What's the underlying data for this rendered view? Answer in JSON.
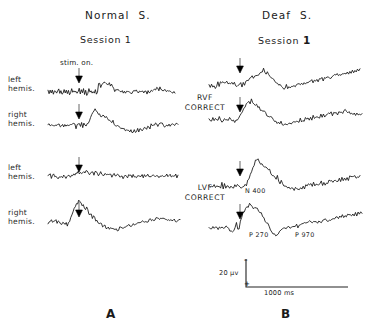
{
  "figure": {
    "columns": [
      {
        "title": "Normal  S.",
        "session": "Session 1",
        "panel_letter": "A"
      },
      {
        "title": "Deaf  S.",
        "session": "Session ",
        "session_bold": "1",
        "panel_letter": "B"
      }
    ],
    "stim_marker_label": "stim. on.",
    "conditions": [
      {
        "line1": "RVF",
        "line2": "CORRECT"
      },
      {
        "line1": "LVF",
        "line2": "CORRECT"
      }
    ],
    "row_labels": [
      {
        "line1": "left",
        "line2": "hemis."
      },
      {
        "line1": "right",
        "line2": "hemis."
      },
      {
        "line1": "left",
        "line2": "hemis."
      },
      {
        "line1": "right",
        "line2": "hemis."
      }
    ],
    "peak_labels": [
      {
        "text": "N 400"
      },
      {
        "text": "P 270"
      },
      {
        "text": "P 970"
      }
    ],
    "scale": {
      "amplitude": "20 μv",
      "time": "1000 ms",
      "negative_sign": "–",
      "positive_sign": "+"
    },
    "colors": {
      "trace": "#111111",
      "text": "#1a1a1a",
      "background": "#ffffff"
    }
  },
  "chart_data": {
    "type": "line",
    "xlabel": "time",
    "ylabel": "amplitude",
    "axis_note": "negative up",
    "x_scale_bar_ms": 1000,
    "y_scale_bar_uv": 20,
    "annotations": [
      {
        "text": "stim. on.",
        "series": "normal-rvf-left",
        "meaning": "stimulus onset arrow"
      },
      {
        "text": "N 400",
        "series": "deaf-lvf-left",
        "latency_ms": 400,
        "polarity": "negative"
      },
      {
        "text": "P 270",
        "series": "deaf-lvf-right",
        "latency_ms": 270,
        "polarity": "positive"
      },
      {
        "text": "P 970",
        "series": "deaf-lvf-right",
        "latency_ms": 970,
        "polarity": "positive"
      }
    ],
    "series": [
      {
        "name": "normal-rvf-left",
        "subject": "Normal S.",
        "condition": "RVF CORRECT",
        "hemisphere": "left hemis.",
        "values": [
          0,
          -1,
          2,
          -2,
          1,
          -1,
          2,
          0,
          -2,
          1,
          3,
          -1,
          2,
          -3,
          1,
          4,
          -2,
          2,
          -1,
          3,
          -2,
          1,
          2,
          -1,
          3,
          -2,
          1,
          -3,
          2,
          5,
          -4,
          3,
          -2,
          6,
          -3,
          2,
          -5,
          1,
          3,
          -2,
          4,
          -1,
          2,
          -3,
          5,
          -2,
          1,
          12,
          14,
          11,
          15,
          12,
          14,
          16,
          13,
          15,
          12,
          14,
          11,
          13,
          9,
          6,
          4,
          5,
          3,
          4,
          2,
          3,
          1,
          2,
          0,
          1,
          -1,
          0,
          2,
          1,
          -1,
          0,
          1,
          -1,
          0,
          1,
          2,
          0,
          -1,
          1,
          0,
          -1,
          1,
          -2,
          0,
          1,
          -1,
          2,
          0,
          1,
          3,
          2,
          4,
          3,
          5,
          4,
          6,
          5,
          7,
          6,
          5,
          4,
          3,
          4,
          3,
          2,
          3,
          2,
          1,
          2,
          1,
          0,
          1
        ]
      },
      {
        "name": "normal-rvf-right",
        "subject": "Normal S.",
        "condition": "RVF CORRECT",
        "hemisphere": "right hemis.",
        "values": [
          0,
          1,
          -1,
          0,
          1,
          -1,
          0,
          1,
          -1,
          1,
          0,
          -1,
          1,
          0,
          -2,
          1,
          0,
          -1,
          2,
          -1,
          0,
          1,
          -1,
          2,
          0,
          -3,
          2,
          -1,
          3,
          -2,
          1,
          -4,
          2,
          0,
          -2,
          3,
          5,
          9,
          13,
          17,
          20,
          23,
          25,
          24,
          22,
          20,
          18,
          16,
          15,
          17,
          14,
          12,
          13,
          10,
          8,
          9,
          6,
          4,
          5,
          2,
          0,
          1,
          -2,
          -4,
          -3,
          -6,
          -5,
          -7,
          -6,
          -8,
          -7,
          -9,
          -8,
          -10,
          -9,
          -11,
          -10,
          -9,
          -11,
          -10,
          -8,
          -9,
          -7,
          -8,
          -6,
          -7,
          -5,
          -4,
          -6,
          -3,
          -2,
          -4,
          -1,
          0,
          -2,
          1,
          0,
          2,
          1,
          3,
          2,
          1,
          3,
          2,
          0,
          1,
          0,
          -1,
          0,
          1,
          -1,
          0,
          1,
          -1,
          0,
          1,
          0
        ]
      },
      {
        "name": "deaf-rvf-left",
        "subject": "Deaf S.",
        "condition": "RVF CORRECT",
        "hemisphere": "left hemis.",
        "values": [
          0,
          -2,
          3,
          -1,
          2,
          -3,
          1,
          4,
          2,
          6,
          3,
          7,
          5,
          4,
          6,
          3,
          5,
          2,
          4,
          1,
          3,
          0,
          2,
          -1,
          1,
          3,
          2,
          5,
          4,
          8,
          12,
          10,
          14,
          11,
          16,
          13,
          18,
          15,
          20,
          17,
          22,
          24,
          21,
          26,
          23,
          20,
          22,
          19,
          17,
          15,
          13,
          11,
          9,
          7,
          5,
          3,
          1,
          -1,
          -3,
          -2,
          -4,
          -1,
          -3,
          0,
          -2,
          1,
          -1,
          2,
          0,
          3,
          1,
          4,
          2,
          5,
          3,
          6,
          4,
          7,
          5,
          8,
          6,
          9,
          7,
          10,
          8,
          11,
          9,
          12,
          10,
          13,
          11,
          14,
          12,
          15,
          13,
          16,
          14,
          17,
          15,
          18,
          16,
          19,
          17,
          20,
          18,
          21,
          19,
          22,
          20,
          23,
          21,
          24,
          22,
          25,
          23,
          26,
          24,
          27,
          25,
          28
        ]
      },
      {
        "name": "deaf-rvf-right",
        "subject": "Deaf S.",
        "condition": "RVF CORRECT",
        "hemisphere": "right hemis.",
        "values": [
          0,
          2,
          -1,
          1,
          -2,
          0,
          2,
          -1,
          3,
          1,
          -2,
          0,
          2,
          -3,
          1,
          -1,
          2,
          0,
          -2,
          1,
          -3,
          0,
          2,
          4,
          8,
          12,
          16,
          20,
          24,
          28,
          30,
          33,
          31,
          34,
          32,
          30,
          28,
          26,
          24,
          22,
          20,
          18,
          16,
          14,
          12,
          10,
          8,
          6,
          4,
          2,
          0,
          -2,
          -4,
          -6,
          -5,
          -7,
          -6,
          -8,
          -7,
          -6,
          -8,
          -5,
          -7,
          -4,
          -6,
          -3,
          -5,
          -2,
          -4,
          -1,
          -3,
          0,
          -2,
          1,
          -1,
          2,
          0,
          3,
          1,
          4,
          2,
          5,
          3,
          6,
          4,
          7,
          5,
          8,
          6,
          9,
          7,
          10,
          8,
          11,
          9,
          12,
          10,
          13,
          11,
          14,
          12,
          15,
          13,
          16,
          14,
          17,
          15,
          16,
          14,
          15,
          13,
          14,
          12,
          13,
          11,
          12,
          10,
          11,
          9,
          10
        ]
      },
      {
        "name": "normal-lvf-left",
        "subject": "Normal S.",
        "condition": "LVF CORRECT",
        "hemisphere": "left hemis.",
        "values": [
          0,
          -1,
          1,
          -2,
          0,
          1,
          -1,
          2,
          0,
          -1,
          1,
          -2,
          0,
          -3,
          1,
          -1,
          -4,
          -2,
          0,
          2,
          1,
          3,
          2,
          4,
          3,
          5,
          4,
          6,
          5,
          7,
          6,
          8,
          7,
          6,
          8,
          7,
          6,
          5,
          7,
          6,
          5,
          4,
          6,
          5,
          4,
          3,
          5,
          4,
          3,
          2,
          4,
          3,
          2,
          1,
          3,
          2,
          1,
          0,
          2,
          1,
          0,
          -1,
          1,
          0,
          -1,
          0,
          1,
          -1,
          0,
          1,
          0,
          -1,
          1,
          0,
          1,
          -1,
          0,
          1,
          0,
          -1,
          1,
          0,
          -1,
          0,
          1,
          -1,
          0,
          -1,
          1,
          0,
          -1,
          0,
          1,
          -1,
          0,
          1,
          0,
          -1,
          1,
          0,
          -1,
          0,
          1,
          0,
          -1,
          0,
          1,
          -1,
          0,
          1,
          0,
          -1,
          0,
          1,
          0,
          -1,
          0
        ]
      },
      {
        "name": "normal-lvf-right",
        "subject": "Normal S.",
        "condition": "LVF CORRECT",
        "hemisphere": "right hemis.",
        "values": [
          0,
          1,
          -1,
          0,
          1,
          -1,
          0,
          1,
          -1,
          0,
          1,
          -1,
          -2,
          0,
          -1,
          -3,
          -2,
          -4,
          0,
          4,
          8,
          12,
          16,
          20,
          24,
          28,
          32,
          36,
          34,
          30,
          26,
          28,
          24,
          20,
          22,
          18,
          14,
          16,
          12,
          8,
          10,
          6,
          4,
          2,
          0,
          -2,
          -4,
          -3,
          -5,
          -7,
          -6,
          -8,
          -10,
          -9,
          -11,
          -10,
          -12,
          -11,
          -13,
          -12,
          -11,
          -13,
          -12,
          -10,
          -11,
          -9,
          -10,
          -8,
          -9,
          -7,
          -8,
          -6,
          -7,
          -5,
          -6,
          -4,
          -5,
          -3,
          -4,
          -2,
          -3,
          -1,
          -2,
          0,
          -1,
          1,
          0,
          2,
          1,
          3,
          2,
          4,
          3,
          5,
          4,
          6,
          5,
          7,
          6,
          5,
          7,
          6,
          5,
          6,
          5,
          4,
          5,
          4,
          3,
          4,
          3,
          2,
          3,
          2,
          1,
          2,
          1
        ]
      },
      {
        "name": "deaf-lvf-left",
        "subject": "Deaf S.",
        "condition": "LVF CORRECT",
        "hemisphere": "left hemis.",
        "values": [
          0,
          -2,
          2,
          -1,
          3,
          -2,
          1,
          -3,
          2,
          -1,
          3,
          -2,
          1,
          -4,
          2,
          0,
          -2,
          1,
          -3,
          0,
          2,
          -1,
          1,
          -2,
          0,
          -3,
          1,
          -1,
          2,
          0,
          6,
          12,
          18,
          24,
          30,
          36,
          42,
          46,
          44,
          40,
          36,
          38,
          34,
          30,
          32,
          28,
          24,
          26,
          22,
          18,
          20,
          16,
          12,
          14,
          10,
          6,
          8,
          4,
          0,
          2,
          -2,
          -4,
          -3,
          -5,
          -4,
          -6,
          -5,
          -4,
          -6,
          -3,
          -5,
          -2,
          -4,
          -1,
          -3,
          0,
          -2,
          1,
          -1,
          2,
          0,
          3,
          1,
          4,
          2,
          5,
          3,
          6,
          4,
          7,
          5,
          8,
          6,
          9,
          7,
          8,
          6,
          9,
          7,
          10,
          8,
          11,
          9,
          12,
          10,
          13,
          11,
          14,
          12,
          15,
          13,
          16,
          14,
          17,
          15,
          16,
          14,
          17
        ]
      },
      {
        "name": "deaf-lvf-right",
        "subject": "Deaf S.",
        "condition": "LVF CORRECT",
        "hemisphere": "right hemis.",
        "values": [
          0,
          2,
          -2,
          1,
          -3,
          0,
          2,
          -1,
          3,
          -2,
          1,
          -3,
          0,
          2,
          -1,
          1,
          -4,
          -2,
          -6,
          -3,
          4,
          10,
          -2,
          2,
          14,
          20,
          26,
          32,
          36,
          40,
          38,
          42,
          40,
          38,
          36,
          34,
          36,
          32,
          30,
          28,
          26,
          22,
          18,
          14,
          10,
          6,
          2,
          -2,
          -6,
          -10,
          -8,
          -12,
          -10,
          -8,
          -6,
          -4,
          -2,
          0,
          -1,
          1,
          0,
          2,
          1,
          3,
          2,
          4,
          3,
          5,
          4,
          6,
          5,
          7,
          6,
          8,
          7,
          9,
          8,
          10,
          9,
          8,
          10,
          9,
          11,
          10,
          12,
          11,
          13,
          12,
          14,
          13,
          15,
          14,
          16,
          15,
          17,
          16,
          18,
          17,
          19,
          18,
          20,
          19,
          21,
          20,
          22,
          21,
          23,
          22,
          24,
          23,
          25,
          24,
          26,
          25,
          27,
          26,
          28,
          27
        ]
      }
    ]
  }
}
